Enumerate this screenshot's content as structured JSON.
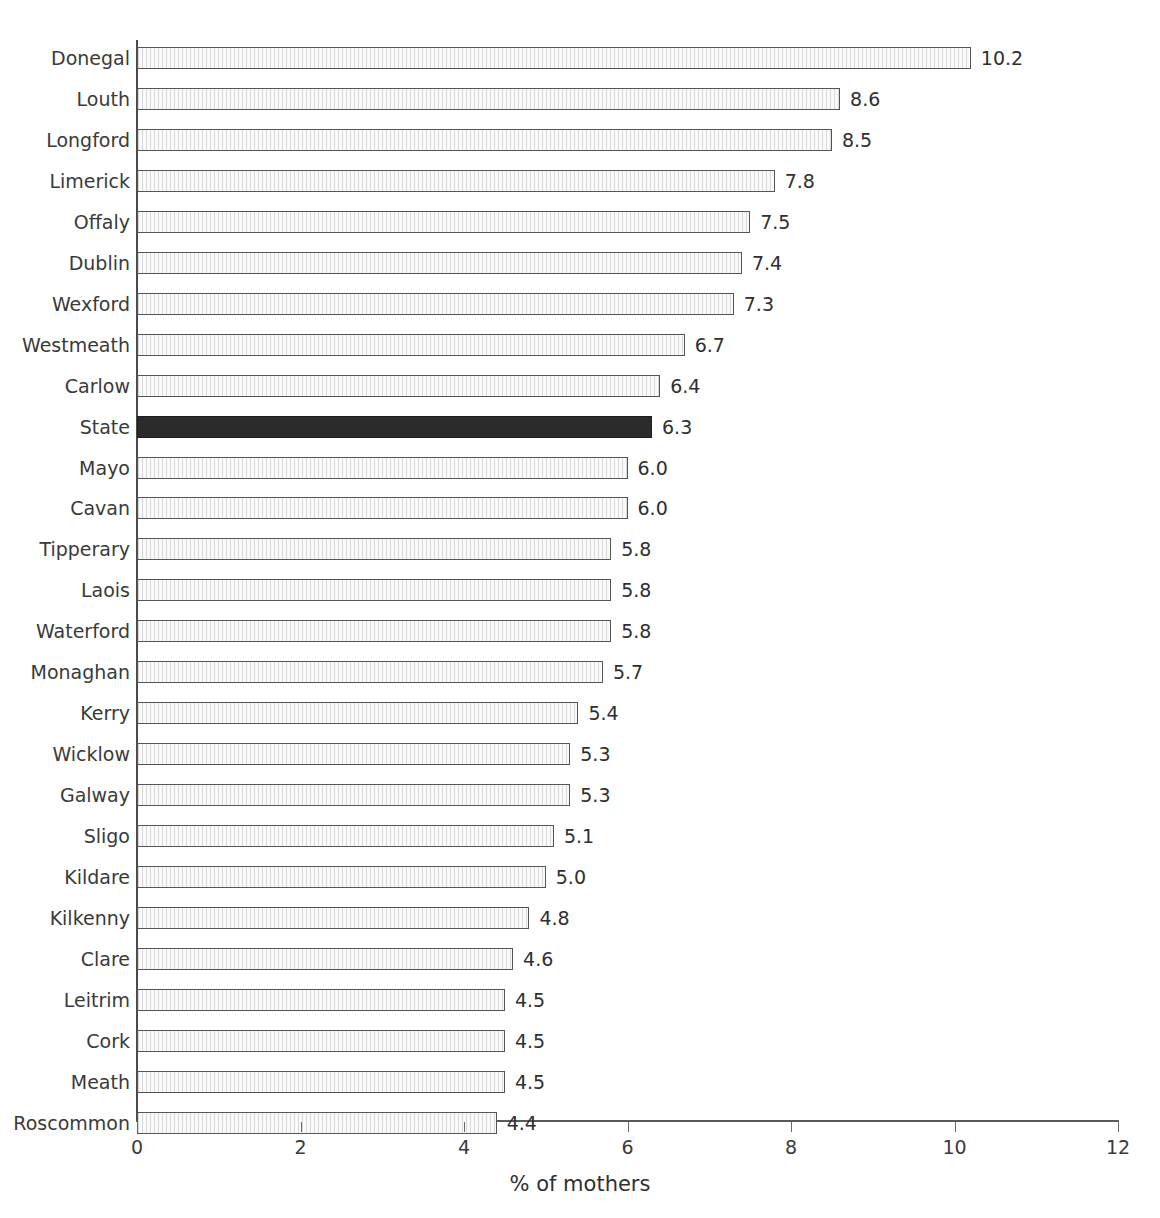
{
  "chart_data": {
    "type": "bar",
    "orientation": "horizontal",
    "title": "",
    "subtitle": "",
    "xlabel": "% of mothers",
    "ylabel": "",
    "xlim": [
      0,
      12
    ],
    "xticks": [
      0,
      2,
      4,
      6,
      8,
      10,
      12
    ],
    "xtick_labels": [
      "0",
      "2",
      "4",
      "6",
      "8",
      "10",
      "12"
    ],
    "grid": false,
    "legend": null,
    "highlight_category": "State",
    "categories": [
      "Donegal",
      "Louth",
      "Longford",
      "Limerick",
      "Offaly",
      "Dublin",
      "Wexford",
      "Westmeath",
      "Carlow",
      "State",
      "Mayo",
      "Cavan",
      "Tipperary",
      "Laois",
      "Waterford",
      "Monaghan",
      "Kerry",
      "Wicklow",
      "Galway",
      "Sligo",
      "Kildare",
      "Kilkenny",
      "Clare",
      "Leitrim",
      "Cork",
      "Meath",
      "Roscommon"
    ],
    "values": [
      10.2,
      8.6,
      8.5,
      7.8,
      7.5,
      7.4,
      7.3,
      6.7,
      6.4,
      6.3,
      6.0,
      6.0,
      5.8,
      5.8,
      5.8,
      5.7,
      5.4,
      5.3,
      5.3,
      5.1,
      5.0,
      4.8,
      4.6,
      4.5,
      4.5,
      4.5,
      4.4
    ],
    "value_labels": [
      "10.2",
      "8.6",
      "8.5",
      "7.8",
      "7.5",
      "7.4",
      "7.3",
      "6.7",
      "6.4",
      "6.3",
      "6.0",
      "6.0",
      "5.8",
      "5.8",
      "5.8",
      "5.7",
      "5.4",
      "5.3",
      "5.3",
      "5.1",
      "5.0",
      "4.8",
      "4.6",
      "4.5",
      "4.5",
      "4.5",
      "4.4"
    ],
    "colors": {
      "bar_fill": "#f2f2f2",
      "bar_hatch": "#d9d9d9",
      "bar_border": "#555555",
      "highlight_fill": "#2b2b2b",
      "highlight_border": "#1f1f1f",
      "axis": "#5a5a5a",
      "text": "#2f2f2f",
      "background": "#ffffff"
    }
  }
}
